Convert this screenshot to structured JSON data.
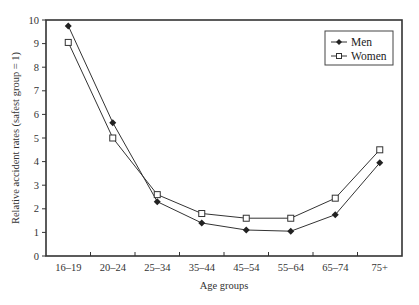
{
  "chart_data": {
    "type": "line",
    "title": "",
    "xlabel": "Age groups",
    "ylabel": "Relative accident rates (safest group = 1)",
    "categories": [
      "16–19",
      "20–24",
      "25–34",
      "35–44",
      "45–54",
      "55–64",
      "65–74",
      "75+"
    ],
    "series": [
      {
        "name": "Men",
        "marker": "filled-diamond",
        "values": [
          9.75,
          5.65,
          2.3,
          1.4,
          1.1,
          1.05,
          1.75,
          3.95
        ]
      },
      {
        "name": "Women",
        "marker": "open-square",
        "values": [
          9.05,
          5.0,
          2.6,
          1.8,
          1.6,
          1.6,
          2.45,
          4.5
        ]
      }
    ],
    "ylim": [
      0,
      10
    ],
    "yticks": [
      0,
      1,
      2,
      3,
      4,
      5,
      6,
      7,
      8,
      9,
      10
    ],
    "grid": false,
    "legend_position": "upper right"
  },
  "legend": {
    "men_label": "Men",
    "women_label": "Women"
  },
  "axes": {
    "xlabel": "Age groups",
    "ylabel": "Relative accident rates (safest group = 1)"
  }
}
